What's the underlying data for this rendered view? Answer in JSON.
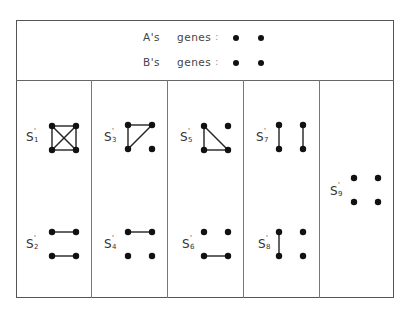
{
  "header": {
    "rows": [
      {
        "owner": "A's",
        "word": "genes",
        "colon": ":",
        "genes": 2
      },
      {
        "owner": "B's",
        "word": "genes",
        "colon": ":",
        "genes": 2
      }
    ]
  },
  "states": [
    {
      "id": "S1",
      "base": "S",
      "sup": "'",
      "sub": "1",
      "edges": [
        [
          0,
          1
        ],
        [
          2,
          3
        ],
        [
          0,
          2
        ],
        [
          1,
          3
        ],
        [
          0,
          3
        ],
        [
          1,
          2
        ]
      ]
    },
    {
      "id": "S2",
      "base": "S",
      "sup": "'",
      "sub": "2",
      "edges": [
        [
          0,
          1
        ],
        [
          2,
          3
        ]
      ]
    },
    {
      "id": "S3",
      "base": "S",
      "sup": "'",
      "sub": "3",
      "edges": [
        [
          0,
          1
        ],
        [
          0,
          2
        ],
        [
          1,
          2
        ]
      ]
    },
    {
      "id": "S4",
      "base": "S",
      "sup": "'",
      "sub": "4",
      "edges": [
        [
          0,
          1
        ]
      ]
    },
    {
      "id": "S5",
      "base": "S",
      "sup": "'",
      "sub": "5",
      "edges": [
        [
          0,
          2
        ],
        [
          2,
          3
        ],
        [
          0,
          3
        ]
      ]
    },
    {
      "id": "S6",
      "base": "S",
      "sup": "'",
      "sub": "6",
      "edges": [
        [
          2,
          3
        ]
      ]
    },
    {
      "id": "S7",
      "base": "S",
      "sup": "'",
      "sub": "7",
      "edges": [
        [
          0,
          2
        ],
        [
          1,
          3
        ]
      ]
    },
    {
      "id": "S8",
      "base": "S",
      "sup": "'",
      "sub": "8",
      "edges": [
        [
          0,
          2
        ]
      ]
    },
    {
      "id": "S9",
      "base": "S",
      "sup": "'",
      "sub": "9",
      "edges": []
    }
  ],
  "colors": {
    "line": "#222222",
    "node": "#111111",
    "border": "#555555"
  }
}
